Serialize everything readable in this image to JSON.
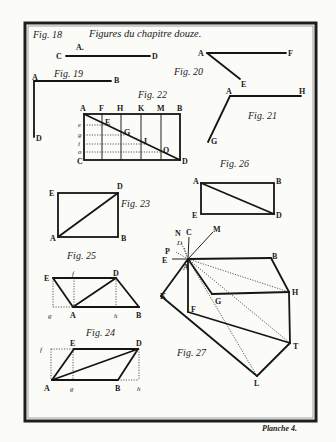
{
  "plate": {
    "title": "Figures du chapitre douze.",
    "plate_label": "Planche 4.",
    "colors": {
      "paper": "#fbfbf8",
      "ink": "#151515",
      "border": "#1e1e1e"
    }
  },
  "figures": {
    "fig18": {
      "label": "Fig. 18",
      "points": [
        "A.",
        "C",
        "D"
      ]
    },
    "fig19": {
      "label": "Fig. 19",
      "points": [
        "A",
        "B",
        "D"
      ]
    },
    "fig20": {
      "label": "Fig. 20",
      "points": [
        "A",
        "F",
        "E"
      ]
    },
    "fig21": {
      "label": "Fig. 21",
      "points": [
        "A",
        "H",
        "G"
      ]
    },
    "fig22": {
      "label": "Fig. 22",
      "top": [
        "A",
        "F",
        "H",
        "K",
        "M",
        "B"
      ],
      "left": [
        "e",
        "g",
        "i",
        "o",
        "C"
      ],
      "inner": [
        "E",
        "G",
        "I",
        "O"
      ],
      "corner": "D"
    },
    "fig23": {
      "label": "Fig. 23",
      "points": [
        "E",
        "D",
        "A",
        "B"
      ]
    },
    "fig24": {
      "label": "Fig. 24",
      "points": [
        "f",
        "E",
        "D",
        "A",
        "g",
        "B",
        "h"
      ]
    },
    "fig25": {
      "label": "Fig. 25",
      "points": [
        "E",
        "f",
        "D",
        "g",
        "A",
        "h",
        "B"
      ]
    },
    "fig26": {
      "label": "Fig. 26",
      "points": [
        "A",
        "B",
        "E",
        "D"
      ]
    },
    "fig27": {
      "label": "Fig. 27",
      "points": [
        "N",
        "C",
        "M",
        "D",
        "P",
        "E",
        "A",
        "B",
        "H",
        "K",
        "G",
        "F",
        "T",
        "L"
      ]
    }
  }
}
